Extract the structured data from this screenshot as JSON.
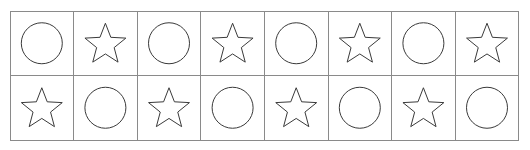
{
  "worksheet": {
    "name": "shape-pattern-grid",
    "background_color": "#ffffff",
    "grid_line_color": "#8a8a8a",
    "shape_stroke_color": "#3a3a3a",
    "shape_fill": "none",
    "columns": 8,
    "rows": 2,
    "cell_width": 63.6,
    "cell_height": 64.5,
    "origin_x": 10,
    "origin_y": 11,
    "pattern": "alternating checkerboard of circle and star outlines"
  },
  "legend": {
    "circle_label": "circle",
    "star_label": "star"
  },
  "cells": [
    {
      "row": 0,
      "col": 0,
      "shape": "circle",
      "name": "cell-r1-c1-circle"
    },
    {
      "row": 0,
      "col": 1,
      "shape": "star",
      "name": "cell-r1-c2-star"
    },
    {
      "row": 0,
      "col": 2,
      "shape": "circle",
      "name": "cell-r1-c3-circle"
    },
    {
      "row": 0,
      "col": 3,
      "shape": "star",
      "name": "cell-r1-c4-star"
    },
    {
      "row": 0,
      "col": 4,
      "shape": "circle",
      "name": "cell-r1-c5-circle"
    },
    {
      "row": 0,
      "col": 5,
      "shape": "star",
      "name": "cell-r1-c6-star"
    },
    {
      "row": 0,
      "col": 6,
      "shape": "circle",
      "name": "cell-r1-c7-circle"
    },
    {
      "row": 0,
      "col": 7,
      "shape": "star",
      "name": "cell-r1-c8-star"
    },
    {
      "row": 1,
      "col": 0,
      "shape": "star",
      "name": "cell-r2-c1-star"
    },
    {
      "row": 1,
      "col": 1,
      "shape": "circle",
      "name": "cell-r2-c2-circle"
    },
    {
      "row": 1,
      "col": 2,
      "shape": "star",
      "name": "cell-r2-c3-star"
    },
    {
      "row": 1,
      "col": 3,
      "shape": "circle",
      "name": "cell-r2-c4-circle"
    },
    {
      "row": 1,
      "col": 4,
      "shape": "star",
      "name": "cell-r2-c5-star"
    },
    {
      "row": 1,
      "col": 5,
      "shape": "circle",
      "name": "cell-r2-c6-circle"
    },
    {
      "row": 1,
      "col": 6,
      "shape": "star",
      "name": "cell-r2-c7-star"
    },
    {
      "row": 1,
      "col": 7,
      "shape": "circle",
      "name": "cell-r2-c8-circle"
    }
  ]
}
